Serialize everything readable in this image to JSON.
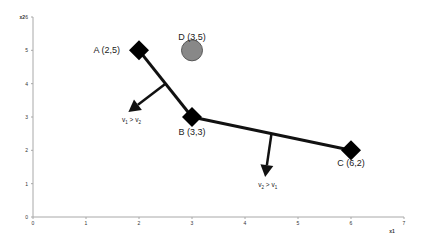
{
  "chart_data": {
    "type": "scatter",
    "title": "",
    "xlabel": "x1",
    "ylabel": "x2",
    "xlim": [
      0,
      7
    ],
    "ylim": [
      0,
      6
    ],
    "grid": false,
    "x_ticks": [
      "0",
      "1",
      "2",
      "3",
      "4",
      "5",
      "6",
      "7"
    ],
    "y_ticks": [
      "0",
      "1",
      "2",
      "3",
      "4",
      "5",
      "6"
    ],
    "points": [
      {
        "name": "A",
        "label": "A (2,5)",
        "x": 2,
        "y": 5,
        "marker": "diamond",
        "color": "#000000"
      },
      {
        "name": "B",
        "label": "B (3,3)",
        "x": 3,
        "y": 3,
        "marker": "diamond",
        "color": "#000000"
      },
      {
        "name": "C",
        "label": "C (6,2)",
        "x": 6,
        "y": 2,
        "marker": "diamond",
        "color": "#000000"
      },
      {
        "name": "D",
        "label": "D (3,5)",
        "x": 3,
        "y": 5,
        "marker": "circle",
        "color": "#888888"
      }
    ],
    "segments": [
      {
        "from": "A",
        "to": "B"
      },
      {
        "from": "B",
        "to": "C"
      }
    ],
    "annotations": [
      {
        "text": "v1 > v2",
        "arrow_from": [
          2.5,
          4.0
        ],
        "arrow_to": [
          1.8,
          3.15
        ],
        "text_pos": [
          1.68,
          2.85
        ]
      },
      {
        "text": "v2 > v1",
        "arrow_from": [
          4.5,
          2.5
        ],
        "arrow_to": [
          4.38,
          1.2
        ],
        "text_pos": [
          4.25,
          0.9
        ]
      }
    ]
  }
}
